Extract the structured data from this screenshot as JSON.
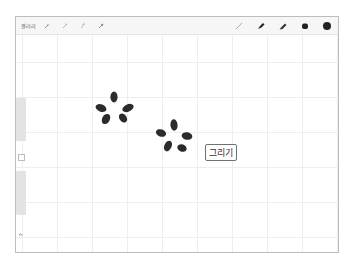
{
  "toolbar": {
    "left_label": "갤러리",
    "left_icons": [
      "wrench-icon",
      "wand-icon",
      "selection-icon",
      "arrow-icon"
    ],
    "brushes": [
      "pencil-icon",
      "marker-icon",
      "brush-icon",
      "smudge-icon",
      "eraser-circle-icon"
    ]
  },
  "canvas": {
    "grid_spacing_px": 35,
    "stamps": [
      {
        "name": "paw-stamp-1",
        "cx": 112,
        "cy": 108
      },
      {
        "name": "paw-stamp-2",
        "cx": 174,
        "cy": 135
      }
    ]
  },
  "sidebar": {
    "items": [
      "brush-size-slider",
      "modify-button",
      "opacity-slider",
      "undo-icon"
    ]
  },
  "draw_button": {
    "label": "그리기"
  },
  "colors": {
    "stroke": "#2b2b2b",
    "grid": "#eeeeee",
    "frame_border": "#bdbdbd",
    "slider": "#e3e3e3"
  }
}
